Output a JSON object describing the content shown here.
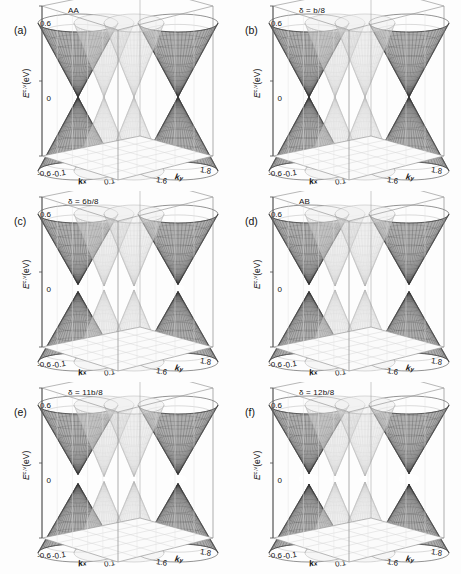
{
  "figure": {
    "axis": {
      "ylabel_main": "E",
      "ylabel_sup": "c,v",
      "ylabel_unit": "(eV)",
      "yticks": [
        "0.6",
        "0",
        "-0.6"
      ],
      "xaxis_name": "k",
      "xaxis_sub": "x",
      "yaxis_name": "k",
      "yaxis_sub": "y",
      "xticks": [
        "-0.1",
        "0.1"
      ],
      "ky_ticks": [
        "1.6",
        "1.8"
      ]
    },
    "panels": [
      {
        "tag": "(a)",
        "condition": "AA",
        "gap": false,
        "stacking": "AA"
      },
      {
        "tag": "(b)",
        "condition": "δ = b/8",
        "gap": false,
        "stacking": "shifted"
      },
      {
        "tag": "(c)",
        "condition": "δ = 6b/8",
        "gap": true,
        "stacking": "shifted"
      },
      {
        "tag": "(d)",
        "condition": "AB",
        "gap": true,
        "stacking": "AB"
      },
      {
        "tag": "(e)",
        "condition": "δ = 11b/8",
        "gap": true,
        "stacking": "shifted"
      },
      {
        "tag": "(f)",
        "condition": "δ = 12b/8",
        "gap": true,
        "stacking": "shifted"
      }
    ]
  },
  "chart_data": {
    "type": "line",
    "title": "",
    "xlabel": "k_x",
    "ylabel": "E^{c,v} (eV)",
    "zlabel": "k_y",
    "xlim": [
      -0.2,
      0.2
    ],
    "ylim": [
      -0.6,
      0.6
    ],
    "zlim": [
      1.5,
      1.9
    ],
    "xticks": [
      -0.1,
      0.1
    ],
    "yticks": [
      -0.6,
      0,
      0.6
    ],
    "zticks": [
      1.6,
      1.8
    ],
    "grid": true,
    "legend": "none",
    "series": [
      {
        "name": "(a) AA",
        "delta": 0.0,
        "gap_eV": 0.0,
        "dirac_cones": 2,
        "gapped": false
      },
      {
        "name": "(b) delta=b/8",
        "delta": 0.125,
        "gap_eV": 0.0,
        "dirac_cones": 2,
        "gapped": false
      },
      {
        "name": "(c) delta=6b/8",
        "delta": 0.75,
        "gap_eV": 0.1,
        "dirac_cones": 2,
        "gapped": true
      },
      {
        "name": "(d) AB",
        "delta": 1.0,
        "gap_eV": 0.1,
        "dirac_cones": 2,
        "gapped": true
      },
      {
        "name": "(e) delta=11b/8",
        "delta": 1.375,
        "gap_eV": 0.12,
        "dirac_cones": 2,
        "gapped": true
      },
      {
        "name": "(f) delta=12b/8",
        "delta": 1.5,
        "gap_eV": 0.14,
        "dirac_cones": 2,
        "gapped": true
      }
    ]
  }
}
